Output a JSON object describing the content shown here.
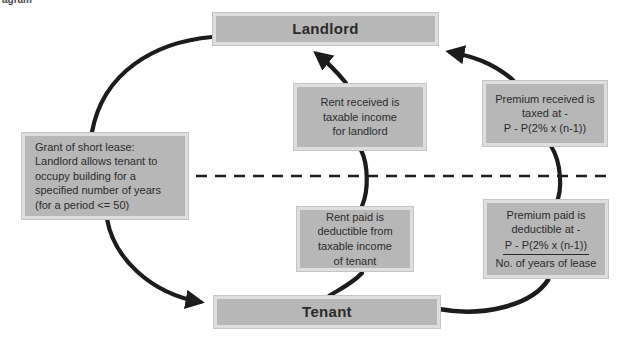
{
  "page": {
    "corner_fragment": "agram"
  },
  "colors": {
    "background": "#ffffff",
    "box_fill": "#b7b7b7",
    "box_border": "#dedede",
    "line": "#1c1c1c",
    "text": "#2b2b2b"
  },
  "nodes": {
    "landlord": {
      "label": "Landlord"
    },
    "tenant": {
      "label": "Tenant"
    },
    "grant": {
      "lines": [
        "Grant of short lease:",
        "Landlord allows tenant to",
        "occupy building for a",
        "specified number of years",
        "(for a period <= 50)"
      ]
    },
    "rent_received": {
      "lines": [
        "Rent received is",
        "taxable income",
        "for landlord"
      ]
    },
    "premium_received": {
      "lines": [
        "Premium received is",
        "taxed at -",
        "P - P(2% x (n-1))"
      ]
    },
    "rent_paid": {
      "lines": [
        "Rent paid is",
        "deductible from",
        "taxable income",
        "of tenant"
      ]
    },
    "premium_paid": {
      "lines": [
        "Premium paid is",
        "deductible at -"
      ],
      "fraction": {
        "numerator": "P - P(2% x (n-1))",
        "denominator": "No. of years of lease"
      }
    }
  }
}
